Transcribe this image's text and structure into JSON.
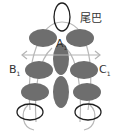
{
  "diagram": {
    "labels": {
      "tail": "尾巴",
      "a": "A",
      "a_sub": "1",
      "b": "B",
      "b_sub": "1",
      "c": "C",
      "c_sub": "1"
    },
    "colors": {
      "fill": "#6e6e6e",
      "outline": "#1e1e1e",
      "guide": "#b4b4b4",
      "text": "#333333"
    }
  }
}
